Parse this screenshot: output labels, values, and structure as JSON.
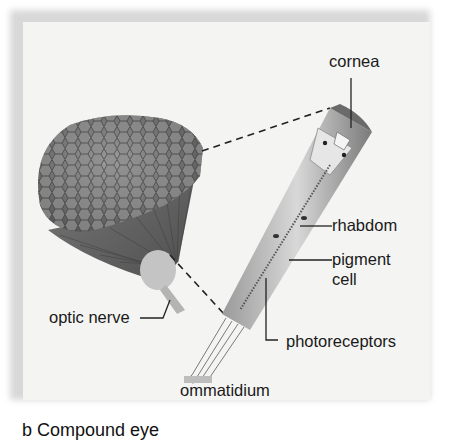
{
  "diagram": {
    "title": "Compound eye",
    "labels": {
      "cornea": "cornea",
      "rhabdom": "rhabdom",
      "pigment_cell": "pigment\ncell",
      "pigment_line1": "pigment",
      "pigment_line2": "cell",
      "photoreceptors": "photoreceptors",
      "optic_nerve": "optic nerve",
      "ommatidium": "ommatidium"
    },
    "caption": "b Compound eye",
    "colors": {
      "panel": "#f4f4f2",
      "eye_dark": "#5a5a5a",
      "eye_mid": "#8a8a8a",
      "leader_line": "#222222"
    }
  }
}
